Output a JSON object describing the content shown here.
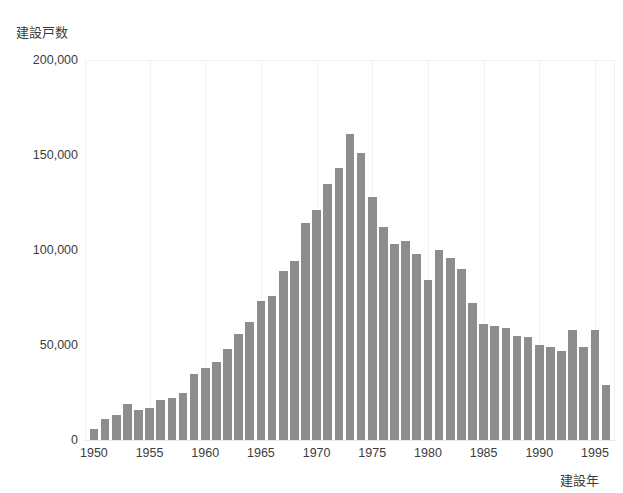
{
  "chart_data": {
    "type": "bar",
    "title": "",
    "subtitle": "",
    "xlabel": "建設年",
    "ylabel": "建設戸数",
    "xlim": [
      1949.2,
      1996.8
    ],
    "ylim": [
      0,
      200000
    ],
    "grid": "vertical-faint",
    "legend": "none",
    "bar_color": "#8d8d8d",
    "y_ticks": [
      "0",
      "50,000",
      "100,000",
      "150,000",
      "200,000"
    ],
    "y_tick_values": [
      0,
      50000,
      100000,
      150000,
      200000
    ],
    "x_ticks": [
      "1950",
      "1955",
      "1960",
      "1965",
      "1970",
      "1975",
      "1980",
      "1985",
      "1990",
      "1995"
    ],
    "x_tick_values": [
      1950,
      1955,
      1960,
      1965,
      1970,
      1975,
      1980,
      1985,
      1990,
      1995
    ],
    "categories": [
      1950,
      1951,
      1952,
      1953,
      1954,
      1955,
      1956,
      1957,
      1958,
      1959,
      1960,
      1961,
      1962,
      1963,
      1964,
      1965,
      1966,
      1967,
      1968,
      1969,
      1970,
      1971,
      1972,
      1973,
      1974,
      1975,
      1976,
      1977,
      1978,
      1979,
      1980,
      1981,
      1982,
      1983,
      1984,
      1985,
      1986,
      1987,
      1988,
      1989,
      1990,
      1991,
      1992,
      1993,
      1994,
      1995,
      1996
    ],
    "values": [
      6000,
      11000,
      13000,
      19000,
      16000,
      17000,
      21000,
      22000,
      25000,
      35000,
      38000,
      41000,
      48000,
      56000,
      62000,
      73000,
      76000,
      89000,
      94000,
      114000,
      121000,
      135000,
      143000,
      161000,
      151000,
      128000,
      112000,
      103000,
      105000,
      98000,
      84000,
      100000,
      96000,
      90000,
      72000,
      61000,
      60000,
      59000,
      55000,
      54000,
      50000,
      49000,
      47000,
      58000,
      49000,
      58000,
      29000
    ],
    "series": [
      {
        "name": "建設戸数",
        "values": [
          6000,
          11000,
          13000,
          19000,
          16000,
          17000,
          21000,
          22000,
          25000,
          35000,
          38000,
          41000,
          48000,
          56000,
          62000,
          73000,
          76000,
          89000,
          94000,
          114000,
          121000,
          135000,
          143000,
          161000,
          151000,
          128000,
          112000,
          103000,
          105000,
          98000,
          84000,
          100000,
          96000,
          90000,
          72000,
          61000,
          60000,
          59000,
          55000,
          54000,
          50000,
          49000,
          47000,
          58000,
          49000,
          58000,
          29000
        ]
      }
    ],
    "annotations": []
  },
  "axes": {
    "y_title": "建設戸数",
    "x_title": "建設年"
  }
}
